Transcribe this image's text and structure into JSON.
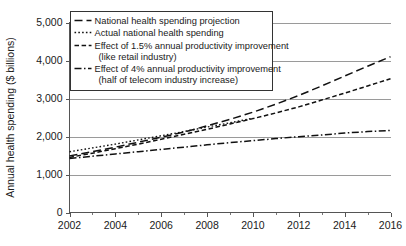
{
  "chart_data": {
    "type": "line",
    "title": "",
    "xlabel": "",
    "ylabel": "Annual health spending ($ billions)",
    "xlim": [
      2002,
      2016
    ],
    "ylim": [
      0,
      5000
    ],
    "grid": true,
    "legend_position": "top-left-inside",
    "x": [
      2002,
      2003,
      2004,
      2005,
      2006,
      2007,
      2008,
      2009,
      2010,
      2011,
      2012,
      2013,
      2014,
      2015,
      2016
    ],
    "xticks": [
      2002,
      2004,
      2006,
      2008,
      2010,
      2012,
      2014,
      2016
    ],
    "xtick_labels": [
      "2002",
      "2004",
      "2006",
      "2008",
      "2010",
      "2012",
      "2014",
      "2016"
    ],
    "xticks_minor": [
      2003,
      2005,
      2007,
      2009,
      2011,
      2013,
      2015
    ],
    "yticks": [
      0,
      1000,
      2000,
      3000,
      4000,
      5000
    ],
    "ytick_labels": [
      "0",
      "1,000",
      "2,000",
      "3,000",
      "4,000",
      "5,000"
    ],
    "series": [
      {
        "name": "National health spending projection",
        "dash": "8,4",
        "width": 1.5,
        "x": [
          2002,
          2003,
          2004,
          2005,
          2006,
          2007,
          2008,
          2009,
          2010,
          2011,
          2012,
          2013,
          2014,
          2015,
          2016
        ],
        "values": [
          1490,
          1600,
          1720,
          1850,
          1980,
          2120,
          2280,
          2450,
          2640,
          2850,
          3080,
          3330,
          3590,
          3850,
          4100
        ]
      },
      {
        "name": "Actual national health spending",
        "dash": "1.6,2.2",
        "width": 1.4,
        "x": [
          2002,
          2003,
          2004,
          2005,
          2006,
          2007,
          2008,
          2009,
          2010
        ],
        "values": [
          1600,
          1700,
          1800,
          1910,
          2020,
          2130,
          2250,
          2360,
          2480
        ]
      },
      {
        "name": "Effect of 1.5% annual productivity improvement (like retail industry)",
        "dash": "4.5,2.6",
        "width": 1.5,
        "x": [
          2002,
          2003,
          2004,
          2005,
          2006,
          2007,
          2008,
          2009,
          2010,
          2011,
          2012,
          2013,
          2014,
          2015,
          2016
        ],
        "values": [
          1450,
          1560,
          1680,
          1800,
          1930,
          2060,
          2190,
          2330,
          2470,
          2620,
          2780,
          2960,
          3140,
          3330,
          3520
        ]
      },
      {
        "name": "Effect of 4% annual productivity improvement (half of telecom industry increase)",
        "dash": "7,2.5,1.5,2.5",
        "width": 1.5,
        "x": [
          2002,
          2003,
          2004,
          2005,
          2006,
          2007,
          2008,
          2009,
          2010,
          2011,
          2012,
          2013,
          2014,
          2015,
          2016
        ],
        "values": [
          1420,
          1480,
          1540,
          1600,
          1660,
          1720,
          1780,
          1840,
          1890,
          1945,
          1995,
          2040,
          2090,
          2130,
          2160
        ]
      }
    ],
    "legend_entries": [
      {
        "line1": "National health spending projection",
        "line2": ""
      },
      {
        "line1": "Actual national health spending",
        "line2": ""
      },
      {
        "line1": "Effect of 1.5% annual productivity improvement",
        "line2": "(like retail industry)"
      },
      {
        "line1": "Effect of 4% annual productivity improvement",
        "line2": "(half of telecom industry increase)"
      }
    ],
    "colors": {
      "line": "#111111",
      "grid": "#9a9a9a",
      "axis": "#555555",
      "text": "#1a1a1a",
      "background": "#ffffff"
    }
  }
}
